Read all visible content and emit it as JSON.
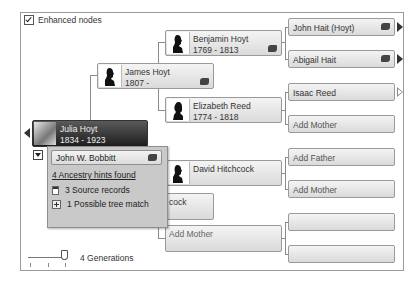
{
  "options": {
    "enhanced_nodes_label": "Enhanced nodes",
    "enhanced_nodes_checked": true
  },
  "focus_person": {
    "name": "Julia Hoyt",
    "dates": "1834 - 1923"
  },
  "spouse_popup": {
    "spouse_name": "John W. Bobbitt",
    "hints_link": "4 Ancestry hints found",
    "items": [
      {
        "icon": "source-record-icon",
        "label": "3 Source records"
      },
      {
        "icon": "tree-match-icon",
        "label": "1 Possible tree match"
      }
    ]
  },
  "generation2": [
    {
      "name": "James Hoyt",
      "dates": "1807 -",
      "has_hint": true
    },
    {
      "name": "...cock",
      "label": "cock"
    }
  ],
  "generation3": [
    {
      "name": "Benjamin Hoyt",
      "dates": "1769 - 1813",
      "has_hint": true
    },
    {
      "name": "Elizabeth Reed",
      "dates": "1774 - 1818",
      "has_hint": false
    },
    {
      "name": "David Hitchcock",
      "dates": "",
      "has_hint": false
    },
    {
      "name": "Add Mother",
      "placeholder": true
    }
  ],
  "generation4": [
    {
      "label": "John Hait (Hoyt)",
      "has_hint": true,
      "expand": "filled"
    },
    {
      "label": "Abigail Hait",
      "has_hint": true,
      "expand": "filled"
    },
    {
      "label": "Isaac Reed",
      "has_hint": false,
      "expand": "hollow"
    },
    {
      "label": "Add Mother",
      "placeholder": true
    },
    {
      "label": "Add Father",
      "placeholder": true
    },
    {
      "label": "Add Mother",
      "placeholder": true
    },
    {
      "label": "",
      "placeholder": true
    },
    {
      "label": "",
      "placeholder": true
    }
  ],
  "generations_slider": {
    "label": "4 Generations",
    "value": 4
  }
}
